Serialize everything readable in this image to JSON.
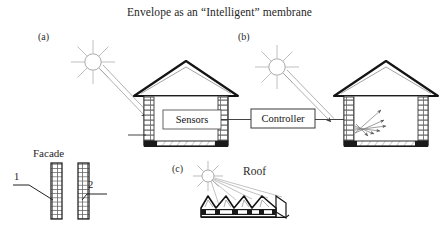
{
  "figure": {
    "title": "Envelope as an “Intelligent” membrane",
    "background_color": "#ffffff",
    "ink_color": "#1a1a1a"
  },
  "panels": [
    {
      "tag": "(a)",
      "name": "panel-a-sensors-house",
      "sun": {
        "name": "sun-icon",
        "rays": 8
      },
      "house": {
        "interior_box_label": "Sensors"
      }
    },
    {
      "tag": "(b)",
      "name": "panel-b-actuated-house",
      "sun": {
        "name": "sun-icon",
        "rays": 8
      },
      "house": {
        "interior_box_label": ""
      }
    },
    {
      "tag": "(c)",
      "name": "panel-c-roof",
      "sun": {
        "name": "sun-icon",
        "rays": 8
      },
      "label": "Roof"
    }
  ],
  "controller": {
    "label": "Controller"
  },
  "facade": {
    "label": "Facade",
    "callouts": [
      {
        "number": "1",
        "name": "facade-callout-1"
      },
      {
        "number": "2",
        "name": "facade-callout-2"
      }
    ]
  }
}
